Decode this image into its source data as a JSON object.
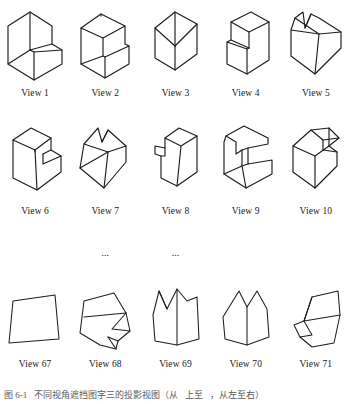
{
  "figure": {
    "caption_segments": [
      "图 6-1",
      "不同视角遮挡图字三的投影视图（从",
      "上至",
      "，从左至右）"
    ],
    "ellipsis": [
      "...",
      "..."
    ]
  },
  "rows": [
    {
      "row_id": "row-1",
      "items": [
        {
          "label": "View 1",
          "shape": "l-block-front-left"
        },
        {
          "label": "View 2",
          "shape": "step-block-left"
        },
        {
          "label": "View 3",
          "shape": "corner-block-tall"
        },
        {
          "label": "View 4",
          "shape": "step-block-right"
        },
        {
          "label": "View 5",
          "shape": "notched-cube-top"
        }
      ]
    },
    {
      "row_id": "row-2",
      "items": [
        {
          "label": "View 6",
          "shape": "slab-with-notch"
        },
        {
          "label": "View 7",
          "shape": "tilted-block-notch"
        },
        {
          "label": "View 8",
          "shape": "tall-block-step"
        },
        {
          "label": "View 9",
          "shape": "open-corner-block"
        },
        {
          "label": "View 10",
          "shape": "z-notch-block"
        }
      ]
    },
    {
      "row_id": "row-3",
      "items": [
        {
          "label": "View 67",
          "shape": "flat-quad"
        },
        {
          "label": "View 68",
          "shape": "folded-poly-a"
        },
        {
          "label": "View 69",
          "shape": "twin-peak-a"
        },
        {
          "label": "View 70",
          "shape": "twin-peak-b"
        },
        {
          "label": "View 71",
          "shape": "folded-poly-b"
        }
      ]
    }
  ],
  "colors": {
    "stroke": "#1d1d1d",
    "background": "#ffffff",
    "text": "#111111"
  }
}
